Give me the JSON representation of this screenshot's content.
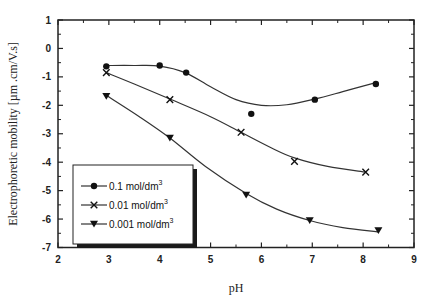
{
  "chart_data": {
    "type": "line",
    "title": "",
    "xlabel": "pH",
    "ylabel": "Electrophoretic mobility  [µm .cm/V.s]",
    "xlim": [
      2,
      9
    ],
    "ylim": [
      -7,
      1
    ],
    "xticks": [
      2,
      3,
      4,
      5,
      6,
      7,
      8,
      9
    ],
    "yticks": [
      1,
      0,
      -1,
      -2,
      -3,
      -4,
      -5,
      -6,
      -7
    ],
    "grid": false,
    "legend_position": "lower left",
    "series": [
      {
        "name": "0.1 mol/dm3",
        "label_main": "0.1 mol/dm",
        "label_sup": "3",
        "marker": "circle",
        "points": [
          [
            2.95,
            -0.63
          ],
          [
            4.0,
            -0.6
          ],
          [
            4.52,
            -0.85
          ],
          [
            5.8,
            -2.3
          ],
          [
            7.05,
            -1.8
          ],
          [
            8.25,
            -1.25
          ]
        ],
        "fit": [
          [
            2.95,
            -0.6
          ],
          [
            3.5,
            -0.6
          ],
          [
            4.0,
            -0.62
          ],
          [
            4.5,
            -0.85
          ],
          [
            5.0,
            -1.35
          ],
          [
            5.5,
            -1.8
          ],
          [
            6.0,
            -2.0
          ],
          [
            6.5,
            -1.98
          ],
          [
            7.05,
            -1.78
          ],
          [
            7.6,
            -1.52
          ],
          [
            8.25,
            -1.2
          ]
        ]
      },
      {
        "name": "0.01 mol/dm3",
        "label_main": "0.01 mol/dm",
        "label_sup": "3",
        "marker": "x",
        "points": [
          [
            2.95,
            -0.85
          ],
          [
            4.2,
            -1.8
          ],
          [
            5.6,
            -2.95
          ],
          [
            6.65,
            -3.97
          ],
          [
            8.05,
            -4.35
          ]
        ],
        "fit": [
          [
            2.95,
            -0.85
          ],
          [
            3.5,
            -1.25
          ],
          [
            4.2,
            -1.78
          ],
          [
            5.0,
            -2.4
          ],
          [
            5.6,
            -2.95
          ],
          [
            6.2,
            -3.5
          ],
          [
            6.65,
            -3.85
          ],
          [
            7.3,
            -4.15
          ],
          [
            8.05,
            -4.35
          ]
        ]
      },
      {
        "name": "0.001 mol/dm3",
        "label_main": "0.001 mol/dm",
        "label_sup": "3",
        "marker": "triangle-down",
        "points": [
          [
            2.95,
            -1.68
          ],
          [
            4.2,
            -3.15
          ],
          [
            5.7,
            -5.15
          ],
          [
            6.95,
            -6.05
          ],
          [
            8.3,
            -6.4
          ]
        ],
        "fit": [
          [
            2.95,
            -1.65
          ],
          [
            3.6,
            -2.4
          ],
          [
            4.2,
            -3.15
          ],
          [
            4.9,
            -4.15
          ],
          [
            5.7,
            -5.1
          ],
          [
            6.3,
            -5.65
          ],
          [
            6.95,
            -6.05
          ],
          [
            7.6,
            -6.3
          ],
          [
            8.3,
            -6.45
          ]
        ]
      }
    ]
  }
}
